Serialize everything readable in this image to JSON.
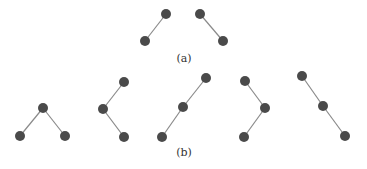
{
  "figure": {
    "node_color": "#4a4a4a",
    "edge_color": "#8a8a8a",
    "node_radius": 5,
    "subfigures": [
      {
        "label": "(a)",
        "label_pos": [
          184,
          52
        ],
        "trees": [
          {
            "nodes": [
              [
                166,
                14
              ],
              [
                145,
                41
              ]
            ],
            "edges": [
              [
                0,
                1
              ]
            ]
          },
          {
            "nodes": [
              [
                200,
                14
              ],
              [
                223,
                41
              ]
            ],
            "edges": [
              [
                0,
                1
              ]
            ]
          }
        ]
      },
      {
        "label": "(b)",
        "label_pos": [
          184,
          146
        ],
        "trees": [
          {
            "nodes": [
              [
                43,
                108
              ],
              [
                20,
                136
              ],
              [
                65,
                136
              ]
            ],
            "edges": [
              [
                0,
                1
              ],
              [
                0,
                2
              ]
            ]
          },
          {
            "nodes": [
              [
                124,
                82
              ],
              [
                103,
                109
              ],
              [
                124,
                137
              ]
            ],
            "edges": [
              [
                0,
                1
              ],
              [
                1,
                2
              ]
            ]
          },
          {
            "nodes": [
              [
                206,
                78
              ],
              [
                183,
                107
              ],
              [
                162,
                137
              ]
            ],
            "edges": [
              [
                0,
                1
              ],
              [
                1,
                2
              ]
            ]
          },
          {
            "nodes": [
              [
                245,
                81
              ],
              [
                265,
                108
              ],
              [
                244,
                137
              ]
            ],
            "edges": [
              [
                0,
                1
              ],
              [
                1,
                2
              ]
            ]
          },
          {
            "nodes": [
              [
                302,
                76
              ],
              [
                323,
                106
              ],
              [
                345,
                136
              ]
            ],
            "edges": [
              [
                0,
                1
              ],
              [
                1,
                2
              ]
            ]
          }
        ]
      }
    ]
  }
}
